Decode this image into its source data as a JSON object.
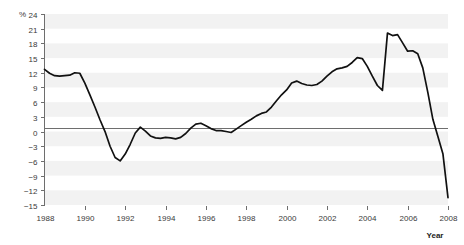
{
  "chart_data": {
    "type": "line",
    "title": "",
    "subtitle": "",
    "xlabel": "Year",
    "ylabel": "%",
    "xlim": [
      1988,
      2008
    ],
    "ylim": [
      -15,
      24
    ],
    "grid": "horizontal-alternating-bands",
    "legend": "none",
    "y_ticks": [
      24,
      21,
      18,
      15,
      12,
      9,
      6,
      3,
      0,
      -3,
      -6,
      -9,
      -12,
      -15
    ],
    "y_tick_labels": [
      "24",
      "21",
      "18",
      "15",
      "12",
      "9",
      "6",
      "3",
      "0",
      "−3",
      "−6",
      "−9",
      "−12",
      "−15"
    ],
    "x_ticks": [
      1988,
      1990,
      1992,
      1994,
      1996,
      1998,
      2000,
      2002,
      2004,
      2006,
      2008
    ],
    "x_tick_labels": [
      "1988",
      "1990",
      "1992",
      "1994",
      "1996",
      "1998",
      "2000",
      "2002",
      "2004",
      "2006",
      "2008"
    ],
    "zero_line": 0,
    "series": [
      {
        "name": "Annual change",
        "color": "#111111",
        "x": [
          1988.0,
          1988.25,
          1988.5,
          1988.75,
          1989.0,
          1989.25,
          1989.5,
          1989.75,
          1990.0,
          1990.25,
          1990.5,
          1990.75,
          1991.0,
          1991.25,
          1991.5,
          1991.75,
          1992.0,
          1992.25,
          1992.5,
          1992.75,
          1993.0,
          1993.25,
          1993.5,
          1993.75,
          1994.0,
          1994.25,
          1994.5,
          1994.75,
          1995.0,
          1995.25,
          1995.5,
          1995.75,
          1996.0,
          1996.25,
          1996.5,
          1996.75,
          1997.0,
          1997.25,
          1997.5,
          1997.75,
          1998.0,
          1998.25,
          1998.5,
          1998.75,
          1999.0,
          1999.25,
          1999.5,
          1999.75,
          2000.0,
          2000.25,
          2000.5,
          2000.75,
          2001.0,
          2001.25,
          2001.5,
          2001.75,
          2002.0,
          2002.25,
          2002.5,
          2002.75,
          2003.0,
          2003.25,
          2003.5,
          2003.75,
          2004.0,
          2004.25,
          2004.5,
          2004.75,
          2005.0,
          2005.25,
          2005.5,
          2005.75,
          2006.0,
          2006.25,
          2006.5,
          2006.75,
          2007.0,
          2007.25,
          2007.5,
          2007.75,
          2008.0
        ],
        "y": [
          12.7,
          11.9,
          11.4,
          11.3,
          11.4,
          11.5,
          12.0,
          11.9,
          9.9,
          7.5,
          5.0,
          2.4,
          0.0,
          -3.0,
          -5.3,
          -6.0,
          -4.6,
          -2.6,
          -0.3,
          0.9,
          0.1,
          -0.9,
          -1.3,
          -1.4,
          -1.2,
          -1.3,
          -1.5,
          -1.2,
          -0.4,
          0.7,
          1.5,
          1.7,
          1.2,
          0.6,
          0.2,
          0.2,
          0.0,
          -0.2,
          0.5,
          1.2,
          1.9,
          2.5,
          3.2,
          3.7,
          4.0,
          5.0,
          6.3,
          7.5,
          8.5,
          9.9,
          10.3,
          9.8,
          9.5,
          9.4,
          9.6,
          10.3,
          11.3,
          12.2,
          12.8,
          13.0,
          13.3,
          14.1,
          15.1,
          14.9,
          13.3,
          11.3,
          9.4,
          8.4,
          9.6,
          13.2,
          15.8,
          16.0,
          15.1,
          13.3,
          12.6,
          12.8,
          14.2,
          17.0,
          19.6,
          21.2,
          21.3
        ]
      }
    ],
    "series_extended_note": "single continuous series 1988-2008",
    "series_tail": {
      "x": [
        2004.75,
        2005.0,
        2005.25,
        2005.5,
        2005.75,
        2006.0,
        2006.25,
        2006.5,
        2006.75,
        2007.0,
        2007.25,
        2007.5,
        2007.75,
        2008.0
      ],
      "y": [
        21.3,
        20.1,
        19.6,
        19.8,
        18.1,
        16.4,
        16.5,
        15.9,
        13.0,
        8.0,
        2.5,
        -1.0,
        -4.6,
        -13.5
      ]
    }
  }
}
